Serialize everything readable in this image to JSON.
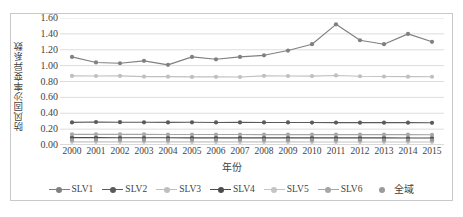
{
  "chart_data": {
    "type": "line",
    "title": "",
    "xlabel": "年份",
    "ylabel": "防风固沙率变异系数",
    "categories": [
      "2000",
      "2001",
      "2002",
      "2003",
      "2004",
      "2005",
      "2006",
      "2007",
      "2008",
      "2009",
      "2010",
      "2011",
      "2012",
      "2013",
      "2014",
      "2015"
    ],
    "ylim": [
      0.0,
      1.6
    ],
    "ytick_labels": [
      "0.00",
      "0.20",
      "0.40",
      "0.60",
      "0.80",
      "1.00",
      "1.20",
      "1.40",
      "1.60"
    ],
    "ytick_values": [
      0.0,
      0.2,
      0.4,
      0.6,
      0.8,
      1.0,
      1.2,
      1.4,
      1.6
    ],
    "grid": true,
    "grid_axis": "y",
    "legend_position": "bottom",
    "series": [
      {
        "name": "SLV1",
        "color": "#808080",
        "marker": "circle",
        "line": true,
        "values": [
          1.11,
          1.04,
          1.03,
          1.06,
          1.01,
          1.11,
          1.08,
          1.11,
          1.13,
          1.19,
          1.27,
          1.52,
          1.32,
          1.27,
          1.4,
          1.3
        ]
      },
      {
        "name": "SLV2",
        "color": "#5a5a5a",
        "marker": "circle",
        "line": true,
        "values": [
          0.285,
          0.29,
          0.287,
          0.286,
          0.285,
          0.286,
          0.284,
          0.285,
          0.284,
          0.284,
          0.283,
          0.282,
          0.281,
          0.281,
          0.281,
          0.28
        ]
      },
      {
        "name": "SLV3",
        "color": "#bfbfbf",
        "marker": "circle",
        "line": true,
        "values": [
          0.87,
          0.869,
          0.87,
          0.862,
          0.861,
          0.858,
          0.859,
          0.857,
          0.871,
          0.869,
          0.868,
          0.876,
          0.866,
          0.863,
          0.861,
          0.86
        ]
      },
      {
        "name": "SLV4",
        "color": "#4d4d4d",
        "marker": "circle",
        "line": true,
        "values": [
          0.092,
          0.092,
          0.091,
          0.091,
          0.091,
          0.09,
          0.09,
          0.09,
          0.09,
          0.09,
          0.089,
          0.089,
          0.089,
          0.089,
          0.088,
          0.088
        ]
      },
      {
        "name": "SLV5",
        "color": "#c4c4c4",
        "marker": "circle",
        "line": true,
        "values": [
          0.04,
          0.04,
          0.04,
          0.04,
          0.039,
          0.039,
          0.039,
          0.039,
          0.039,
          0.039,
          0.038,
          0.038,
          0.038,
          0.038,
          0.038,
          0.038
        ]
      },
      {
        "name": "SLV6",
        "color": "#a6a6a6",
        "marker": "circle",
        "line": true,
        "values": [
          0.133,
          0.134,
          0.133,
          0.133,
          0.132,
          0.132,
          0.132,
          0.132,
          0.131,
          0.131,
          0.131,
          0.131,
          0.13,
          0.13,
          0.13,
          0.129
        ]
      },
      {
        "name": "全域",
        "color": "#9b9b9b",
        "marker": "circle",
        "line": false,
        "values": [
          0.063,
          0.063,
          0.063,
          0.062,
          0.062,
          0.062,
          0.062,
          0.062,
          0.062,
          0.061,
          0.061,
          0.061,
          0.061,
          0.06,
          0.06,
          0.06
        ]
      }
    ]
  },
  "style": {
    "plot_bg": "#ffffff",
    "frame_border": "#c9c9c9",
    "grid_color": "#d9d9d9",
    "text_color": "#3f3f3f"
  }
}
